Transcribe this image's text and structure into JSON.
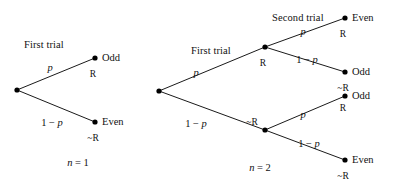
{
  "figure": {
    "background_color": "#ffffff",
    "ink_color": "#000000",
    "node_radius_px": 2.6,
    "edge_width_px": 0.9
  },
  "trees": [
    {
      "id": "tree-n1",
      "caption": "n = 1",
      "caption_var": "n",
      "caption_op": "=",
      "caption_num": "1",
      "headings": [
        {
          "name": "first-trial",
          "text": "First trial",
          "x": 24,
          "y": 40
        }
      ],
      "nodes": [
        {
          "name": "root",
          "x": 17,
          "y": 90,
          "kind": "root"
        },
        {
          "name": "leaf-odd",
          "x": 95,
          "y": 58,
          "kind": "leaf"
        },
        {
          "name": "leaf-even",
          "x": 95,
          "y": 122,
          "kind": "leaf"
        }
      ],
      "edges": [
        {
          "name": "root-to-odd",
          "from": "root",
          "to": "leaf-odd",
          "prob": "p",
          "prob_kind": "p"
        },
        {
          "name": "root-to-even",
          "from": "root",
          "to": "leaf-even",
          "prob": "1 - p",
          "prob_kind": "1-p"
        }
      ],
      "edge_labels": [
        {
          "name": "prob-p",
          "text": "p",
          "x": 50,
          "y": 63
        },
        {
          "name": "prob-1-minus-p",
          "text": "1 - p",
          "x": 52,
          "y": 118
        }
      ],
      "outcomes": [
        {
          "name": "outcome-odd",
          "text": "Odd",
          "x": 102,
          "y": 53
        },
        {
          "name": "outcome-even",
          "text": "Even",
          "x": 102,
          "y": 117
        }
      ],
      "events": [
        {
          "name": "event-r",
          "text": "R",
          "x": 93,
          "y": 70
        },
        {
          "name": "event-not-r",
          "text": "~R",
          "x": 93,
          "y": 134
        }
      ],
      "caption_pos": {
        "x": 78,
        "y": 158
      }
    },
    {
      "id": "tree-n2",
      "caption": "n = 2",
      "caption_var": "n",
      "caption_op": "=",
      "caption_num": "2",
      "headings": [
        {
          "name": "first-trial",
          "text": "First trial",
          "x": 191,
          "y": 46
        },
        {
          "name": "second-trial",
          "text": "Second trial",
          "x": 272,
          "y": 13
        }
      ],
      "nodes": [
        {
          "name": "root",
          "x": 159,
          "y": 91,
          "kind": "root"
        },
        {
          "name": "node-r",
          "x": 265,
          "y": 47,
          "kind": "internal"
        },
        {
          "name": "node-not-r",
          "x": 265,
          "y": 130,
          "kind": "internal"
        },
        {
          "name": "leaf-even-top",
          "x": 345,
          "y": 18,
          "kind": "leaf"
        },
        {
          "name": "leaf-odd-upper",
          "x": 345,
          "y": 72,
          "kind": "leaf"
        },
        {
          "name": "leaf-odd-lower",
          "x": 345,
          "y": 96,
          "kind": "leaf"
        },
        {
          "name": "leaf-even-bottom",
          "x": 345,
          "y": 160,
          "kind": "leaf"
        }
      ],
      "edges": [
        {
          "name": "root-to-r",
          "from": "root",
          "to": "node-r",
          "prob": "p",
          "prob_kind": "p"
        },
        {
          "name": "root-to-not-r",
          "from": "root",
          "to": "node-not-r",
          "prob": "1 - p",
          "prob_kind": "1-p"
        },
        {
          "name": "r-to-even",
          "from": "node-r",
          "to": "leaf-even-top",
          "prob": "p",
          "prob_kind": "p"
        },
        {
          "name": "r-to-odd",
          "from": "node-r",
          "to": "leaf-odd-upper",
          "prob": "1 - p",
          "prob_kind": "1-p"
        },
        {
          "name": "not-r-to-odd",
          "from": "node-not-r",
          "to": "leaf-odd-lower",
          "prob": "p",
          "prob_kind": "p"
        },
        {
          "name": "not-r-to-even",
          "from": "node-not-r",
          "to": "leaf-even-bottom",
          "prob": "1 - p",
          "prob_kind": "1-p"
        }
      ],
      "edge_labels": [
        {
          "name": "prob-root-r",
          "text": "p",
          "x": 196,
          "y": 68
        },
        {
          "name": "prob-root-not-r",
          "text": "1 - p",
          "x": 196,
          "y": 119
        },
        {
          "name": "prob-r-even",
          "text": "p",
          "x": 303,
          "y": 27
        },
        {
          "name": "prob-r-odd",
          "text": "1 - p",
          "x": 307,
          "y": 55
        },
        {
          "name": "prob-not-r-odd",
          "text": "p",
          "x": 303,
          "y": 110
        },
        {
          "name": "prob-not-r-even",
          "text": "1 - p",
          "x": 309,
          "y": 139
        }
      ],
      "outcomes": [
        {
          "name": "outcome-even-top",
          "text": "Even",
          "x": 352,
          "y": 13
        },
        {
          "name": "outcome-odd-upper",
          "text": "Odd",
          "x": 352,
          "y": 67
        },
        {
          "name": "outcome-odd-lower",
          "text": "Odd",
          "x": 352,
          "y": 91
        },
        {
          "name": "outcome-even-bottom",
          "text": "Even",
          "x": 352,
          "y": 155
        }
      ],
      "events": [
        {
          "name": "event-r-top",
          "text": "R",
          "x": 343,
          "y": 30
        },
        {
          "name": "event-r-node",
          "text": "R",
          "x": 263,
          "y": 59
        },
        {
          "name": "event-not-r-upper",
          "text": "~R",
          "x": 343,
          "y": 84
        },
        {
          "name": "event-r-lower",
          "text": "R",
          "x": 343,
          "y": 104
        },
        {
          "name": "event-not-r-node",
          "text": "~R",
          "x": 252,
          "y": 118
        },
        {
          "name": "event-not-r-bottom",
          "text": "~R",
          "x": 343,
          "y": 172
        }
      ],
      "caption_pos": {
        "x": 260,
        "y": 163
      }
    }
  ]
}
